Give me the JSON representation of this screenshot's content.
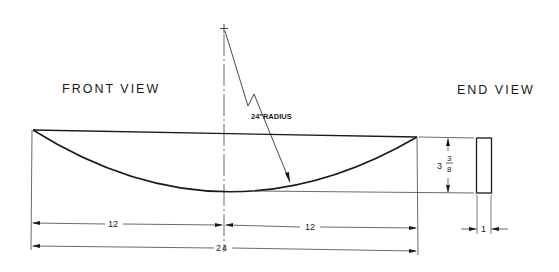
{
  "drawing": {
    "front_view_label": "FRONT VIEW",
    "end_view_label": "END VIEW",
    "radius_label": "24\"RADIUS",
    "dimensions": {
      "half_left": "12",
      "half_right": "12",
      "overall_length": "24",
      "height_whole": "3",
      "height_frac_num": "3",
      "height_frac_den": "8",
      "thickness": "1"
    },
    "colors": {
      "line": "#1a1a1a",
      "thin": "#444444",
      "background": "#ffffff"
    }
  }
}
